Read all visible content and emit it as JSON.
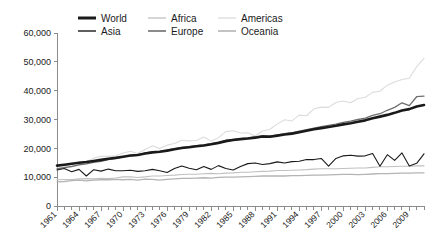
{
  "chart_data": {
    "type": "line",
    "title": "",
    "subtitle": "",
    "xlabel": "",
    "ylabel": "",
    "xlim": [
      1961,
      2011
    ],
    "ylim": [
      0,
      60000
    ],
    "grid": false,
    "legend_position": "top",
    "y_ticks": [
      0,
      10000,
      20000,
      30000,
      40000,
      50000,
      60000
    ],
    "y_tick_labels": [
      "0",
      "10,000",
      "20,000",
      "30,000",
      "40,000",
      "50,000",
      "60,000"
    ],
    "x_ticks": [
      1961,
      1964,
      1967,
      1970,
      1973,
      1976,
      1979,
      1982,
      1985,
      1988,
      1991,
      1994,
      1997,
      2000,
      2003,
      2006,
      2009
    ],
    "x_tick_labels": [
      "1961",
      "1964",
      "1967",
      "1970",
      "1973",
      "1976",
      "1979",
      "1982",
      "1985",
      "1988",
      "1991",
      "1994",
      "1997",
      "2000",
      "2003",
      "2006",
      "2009"
    ],
    "x": [
      1961,
      1962,
      1963,
      1964,
      1965,
      1966,
      1967,
      1968,
      1969,
      1970,
      1971,
      1972,
      1973,
      1974,
      1975,
      1976,
      1977,
      1978,
      1979,
      1980,
      1981,
      1982,
      1983,
      1984,
      1985,
      1986,
      1987,
      1988,
      1989,
      1990,
      1991,
      1992,
      1993,
      1994,
      1995,
      1996,
      1997,
      1998,
      1999,
      2000,
      2001,
      2002,
      2003,
      2004,
      2005,
      2006,
      2007,
      2008,
      2009,
      2010,
      2011
    ],
    "series": [
      {
        "name": "World",
        "color": "#1a1a1a",
        "width": 2.6,
        "values": [
          14000,
          14300,
          14650,
          15000,
          15250,
          15600,
          16000,
          16400,
          16700,
          17100,
          17500,
          17700,
          18200,
          18600,
          18800,
          19200,
          19700,
          20100,
          20400,
          20700,
          21000,
          21400,
          21900,
          22500,
          22900,
          23200,
          23400,
          23700,
          24100,
          24000,
          24400,
          24800,
          25100,
          25600,
          26100,
          26600,
          27000,
          27400,
          27800,
          28300,
          28700,
          29200,
          29700,
          30400,
          31000,
          31600,
          32300,
          33100,
          33600,
          34500,
          35000
        ]
      },
      {
        "name": "Asia",
        "color": "#1a1a1a",
        "width": 1.1,
        "values": [
          12500,
          13000,
          11900,
          12700,
          10400,
          12600,
          12100,
          12800,
          12200,
          12200,
          12400,
          12000,
          12200,
          12700,
          12200,
          11600,
          13000,
          13900,
          13100,
          12600,
          13700,
          12700,
          14000,
          13000,
          12500,
          13700,
          14700,
          14900,
          14400,
          14700,
          15300,
          14900,
          15400,
          15500,
          16100,
          16100,
          16500,
          13800,
          16500,
          17400,
          17600,
          17300,
          17400,
          18200,
          13800,
          17800,
          15800,
          18400,
          13900,
          14800,
          18100
        ]
      },
      {
        "name": "Africa",
        "color": "#c0c0c0",
        "width": 1.1,
        "values": [
          9100,
          9200,
          9200,
          9400,
          9500,
          9400,
          9600,
          9500,
          9700,
          10100,
          10100,
          9900,
          10100,
          10400,
          10400,
          10600,
          10700,
          10900,
          11000,
          11000,
          11200,
          11300,
          11200,
          11400,
          11500,
          11700,
          11700,
          11900,
          12000,
          12100,
          12300,
          12300,
          12400,
          12500,
          12600,
          12800,
          12900,
          12900,
          12900,
          13000,
          13100,
          13200,
          13200,
          13400,
          13600,
          13600,
          13700,
          13800,
          13800,
          13900,
          13900
        ]
      },
      {
        "name": "Americas",
        "color": "#dcdcdc",
        "width": 1.1,
        "values": [
          13200,
          13500,
          14600,
          15200,
          15400,
          16600,
          17200,
          17200,
          17400,
          18400,
          19000,
          18200,
          19600,
          20900,
          19900,
          21100,
          21700,
          22800,
          22600,
          22700,
          23900,
          22500,
          23700,
          25800,
          26100,
          25300,
          25400,
          24300,
          26000,
          26600,
          28400,
          29900,
          29500,
          31500,
          31300,
          33700,
          34300,
          34200,
          35900,
          36400,
          35800,
          37300,
          37700,
          39400,
          39800,
          41900,
          43000,
          43900,
          44300,
          48300,
          51200
        ]
      },
      {
        "name": "Europe",
        "color": "#6e6e6e",
        "width": 1.3,
        "values": [
          12900,
          13300,
          13700,
          14300,
          14600,
          15100,
          15500,
          16100,
          16500,
          17000,
          17400,
          17600,
          18400,
          18800,
          18900,
          19400,
          19900,
          20300,
          20600,
          20900,
          21200,
          21600,
          22000,
          22800,
          23100,
          23400,
          23600,
          24000,
          24400,
          24300,
          24600,
          25100,
          25400,
          26000,
          26500,
          27000,
          27500,
          28000,
          28400,
          29000,
          29400,
          30000,
          30500,
          31400,
          32000,
          33200,
          34200,
          35800,
          34800,
          37900,
          38100
        ]
      },
      {
        "name": "Oceania",
        "color": "#b4b4b4",
        "width": 1.3,
        "values": [
          8400,
          8500,
          8800,
          9000,
          8700,
          9000,
          9100,
          9100,
          9200,
          9100,
          9200,
          9000,
          9300,
          9200,
          9000,
          9200,
          9400,
          9600,
          9600,
          9700,
          9800,
          9700,
          9900,
          10000,
          10000,
          10100,
          10200,
          10300,
          10400,
          10400,
          10400,
          10400,
          10500,
          10500,
          10600,
          10700,
          10700,
          10800,
          10900,
          11000,
          11000,
          10900,
          11000,
          11100,
          11200,
          11200,
          11300,
          11400,
          11400,
          11500,
          11500
        ]
      }
    ]
  },
  "legend": {
    "entries": [
      {
        "label": "World",
        "color": "#1a1a1a",
        "width": 3.0
      },
      {
        "label": "Africa",
        "color": "#c0c0c0",
        "width": 1.3
      },
      {
        "label": "Americas",
        "color": "#dcdcdc",
        "width": 1.3
      },
      {
        "label": "Asia",
        "color": "#1a1a1a",
        "width": 1.4
      },
      {
        "label": "Europe",
        "color": "#6e6e6e",
        "width": 1.6
      },
      {
        "label": "Oceania",
        "color": "#b4b4b4",
        "width": 1.6
      }
    ]
  },
  "layout": {
    "plot_left": 57,
    "plot_right": 424,
    "plot_top": 33,
    "plot_bottom": 206
  }
}
